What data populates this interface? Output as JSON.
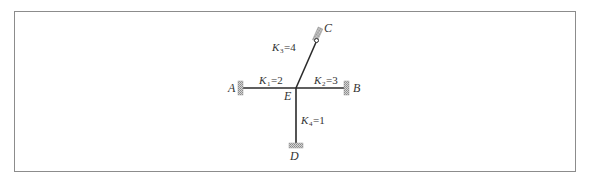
{
  "diagram": {
    "type": "frame-structure",
    "joint": {
      "label": "E"
    },
    "supports": [
      {
        "id": "A",
        "label": "A",
        "side": "left",
        "type": "fixed"
      },
      {
        "id": "B",
        "label": "B",
        "side": "right",
        "type": "fixed"
      },
      {
        "id": "C",
        "label": "C",
        "side": "upper-right",
        "type": "pinned-roller"
      },
      {
        "id": "D",
        "label": "D",
        "side": "bottom",
        "type": "fixed"
      }
    ],
    "members": [
      {
        "id": "EA",
        "stiffness_symbol": "K",
        "subscript": "1",
        "value": "=2"
      },
      {
        "id": "EB",
        "stiffness_symbol": "K",
        "subscript": "2",
        "value": "=3"
      },
      {
        "id": "EC",
        "stiffness_symbol": "K",
        "subscript": "3",
        "value": "=4"
      },
      {
        "id": "ED",
        "stiffness_symbol": "K",
        "subscript": "4",
        "value": "=1"
      }
    ],
    "colors": {
      "line": "#2a2a2a",
      "hatch": "#9a9a9a",
      "border": "#8c8c8c",
      "text": "#333333"
    }
  }
}
